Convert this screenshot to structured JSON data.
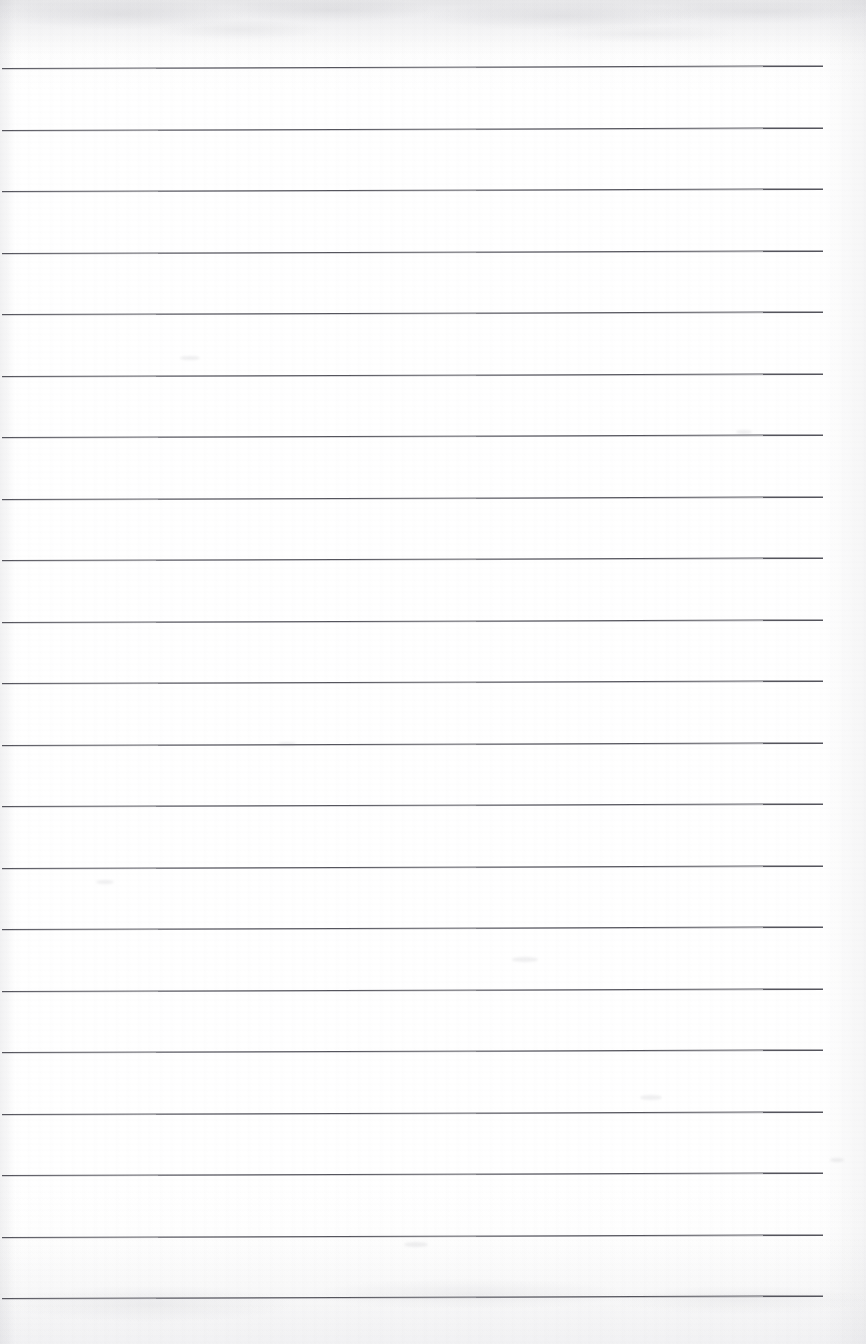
{
  "document": {
    "kind": "scanned-ruled-paper",
    "title": "Blank ruled notepad page",
    "page_width": 866,
    "page_height": 1344,
    "content_text": "",
    "has_handwriting": false,
    "has_printed_text": false
  },
  "paper": {
    "background_color": "#fdfdfd",
    "highlight_color": "#ffffff",
    "edge_tint_color": "#9a9aa2",
    "top_band_height": 58,
    "bottom_band_height": 110,
    "left_edge_width": 16,
    "right_margin_width": 43
  },
  "ruling": {
    "line_color": "#55555d",
    "line_thickness": 1.6,
    "line_count": 21,
    "line_start_x": 2,
    "line_end_x": 823,
    "first_line_y": 68,
    "line_spacing": 61.5,
    "tilt_degrees": -0.18,
    "lines_y": [
      68,
      129.5,
      191,
      252.5,
      314,
      375.5,
      437,
      498.5,
      560,
      621.5,
      683,
      744.5,
      806,
      867.5,
      929,
      990.5,
      1052,
      1113.5,
      1175,
      1236.5,
      1298
    ]
  },
  "artifacts": {
    "smudges": [
      {
        "x": 512,
        "y": 957,
        "w": 26,
        "h": 5
      },
      {
        "x": 278,
        "y": 742,
        "w": 18,
        "h": 4
      },
      {
        "x": 180,
        "y": 356,
        "w": 20,
        "h": 4
      },
      {
        "x": 640,
        "y": 1095,
        "w": 22,
        "h": 5
      },
      {
        "x": 736,
        "y": 430,
        "w": 16,
        "h": 4
      },
      {
        "x": 404,
        "y": 1242,
        "w": 24,
        "h": 5
      },
      {
        "x": 830,
        "y": 1158,
        "w": 14,
        "h": 4
      },
      {
        "x": 96,
        "y": 880,
        "w": 18,
        "h": 4
      }
    ]
  }
}
